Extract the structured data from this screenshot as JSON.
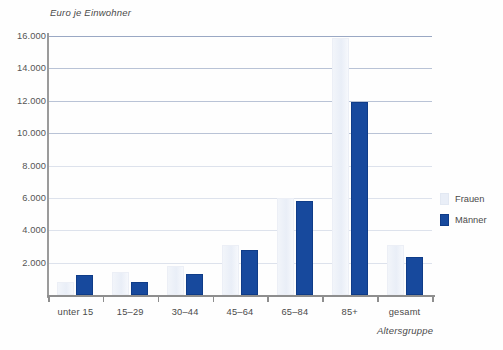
{
  "chart_data": {
    "type": "bar",
    "title": "",
    "ylabel": "Euro je Einwohner",
    "xlabel": "Altersgruppe",
    "categories": [
      "unter 15",
      "15–29",
      "30–44",
      "45–64",
      "65–84",
      "85+",
      "gesamt"
    ],
    "series": [
      {
        "name": "Frauen",
        "color": "#e9eef7",
        "values": [
          820,
          1430,
          1800,
          3120,
          6000,
          15850,
          3120
        ]
      },
      {
        "name": "Männer",
        "color": "#17499d",
        "values": [
          1230,
          830,
          1280,
          2800,
          5800,
          11900,
          2370
        ]
      }
    ],
    "ylim": [
      0,
      16000
    ],
    "ytick_values": [
      0,
      2000,
      4000,
      6000,
      8000,
      10000,
      12000,
      14000,
      16000
    ],
    "ytick_labels": [
      "0",
      "2.000",
      "4.000",
      "6.000",
      "8.000",
      "10.000",
      "12.000",
      "14.000",
      "16.000"
    ],
    "grid": true,
    "legend_position": "right"
  },
  "legend": {
    "items": [
      {
        "label": "Frauen",
        "swatch": "frauen"
      },
      {
        "label": "Männer",
        "swatch": "maenner"
      }
    ]
  }
}
